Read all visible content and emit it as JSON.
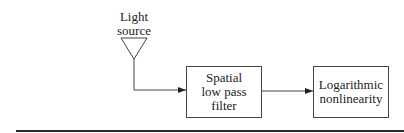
{
  "diagram": {
    "source": {
      "line1": "Light",
      "line2": "source",
      "shape": "triangle"
    },
    "blocks": [
      {
        "line1": "Spatial",
        "line2": "low pass",
        "line3": "filter"
      },
      {
        "line1": "Logarithmic",
        "line2": "nonlinearity"
      }
    ],
    "connections": [
      {
        "from": "Light source",
        "to": "Spatial low pass filter"
      },
      {
        "from": "Spatial low pass filter",
        "to": "Logarithmic nonlinearity"
      }
    ],
    "colors": {
      "stroke": "#444444",
      "text": "#1e1e1e",
      "rule": "#2a2a2a"
    }
  }
}
